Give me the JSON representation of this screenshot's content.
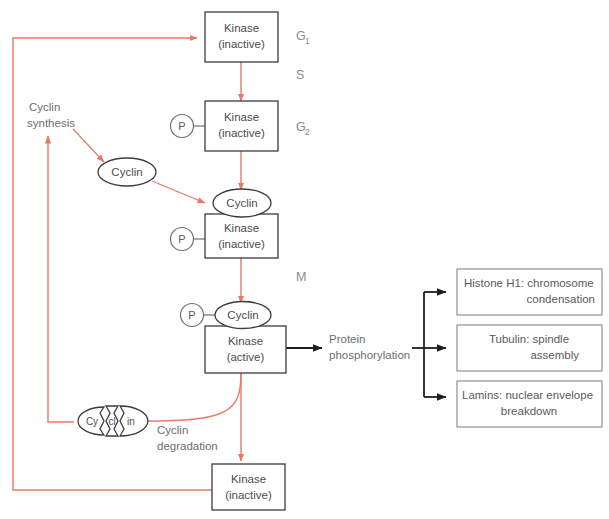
{
  "diagram": {
    "colors": {
      "red_arrow": "#e8786a",
      "black_arrow": "#1f1f1f",
      "box_stroke": "#3d3d3d",
      "outcome_stroke": "#8f8f8f",
      "text": "#5a5a5a",
      "background": "#ffffff"
    },
    "nodes": {
      "kinase_g1": {
        "line1": "Kinase",
        "line2": "(inactive)"
      },
      "kinase_g2": {
        "line1": "Kinase",
        "line2": "(inactive)"
      },
      "kinase_mid": {
        "line1": "Kinase",
        "line2": "(inactive)"
      },
      "kinase_active": {
        "line1": "Kinase",
        "line2": "(active)"
      },
      "kinase_bottom": {
        "line1": "Kinase",
        "line2": "(inactive)"
      },
      "cyclin_free": {
        "label": "Cyclin"
      },
      "cyclin_bound_mid": {
        "label": "Cyclin"
      },
      "cyclin_bound_active": {
        "label": "Cyclin"
      },
      "cyclin_degraded": {
        "fragment1": "Cy",
        "fragment2": "cl",
        "fragment3": "in"
      },
      "phosphate_g2": {
        "label": "P"
      },
      "phosphate_mid": {
        "label": "P"
      },
      "phosphate_active": {
        "label": "P"
      }
    },
    "phase_labels": [
      {
        "name": "G1",
        "base": "G",
        "sub": "1"
      },
      {
        "name": "S",
        "base": "S",
        "sub": ""
      },
      {
        "name": "G2",
        "base": "G",
        "sub": "2"
      },
      {
        "name": "M",
        "base": "M",
        "sub": ""
      }
    ],
    "free_labels": {
      "cyclin_synthesis_line1": "Cyclin",
      "cyclin_synthesis_line2": "synthesis",
      "cyclin_degradation_line1": "Cyclin",
      "cyclin_degradation_line2": "degradation",
      "protein_phosphorylation_line1": "Protein",
      "protein_phosphorylation_line2": "phosphorylation"
    },
    "outcomes": [
      {
        "line1": "Histone H1: chromosome",
        "line2": "condensation",
        "align1": "start",
        "align2": "end"
      },
      {
        "line1": "Tubulin: spindle",
        "line2": "assembly",
        "align1": "middle",
        "align2": "end"
      },
      {
        "line1": "Lamins: nuclear envelope",
        "line2": "breakdown",
        "align1": "start",
        "align2": "middle"
      }
    ]
  }
}
